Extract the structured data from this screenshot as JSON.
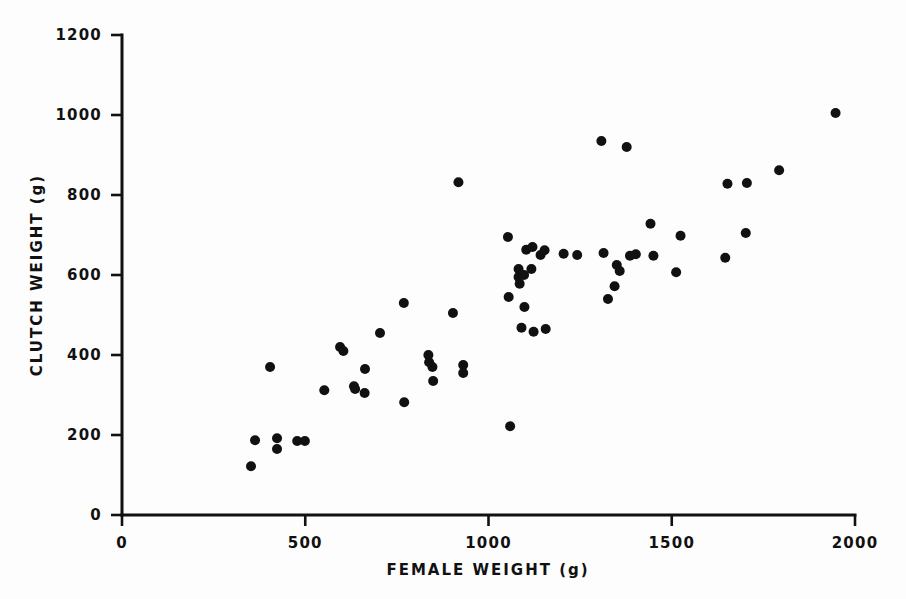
{
  "chart_data": {
    "type": "scatter",
    "title": "",
    "xlabel": "FEMALE WEIGHT (g)",
    "ylabel": "CLUTCH WEIGHT (g)",
    "xlim": [
      0,
      2000
    ],
    "ylim": [
      0,
      1200
    ],
    "xticks": [
      0,
      500,
      1000,
      1500,
      2000
    ],
    "yticks": [
      0,
      200,
      400,
      600,
      800,
      1000,
      1200
    ],
    "xtick_labels": [
      "0",
      "500",
      "1000",
      "1500",
      "2000"
    ],
    "ytick_labels": [
      "0",
      "200",
      "400",
      "600",
      "800",
      "1000",
      "1200"
    ],
    "grid": false,
    "legend": null,
    "marker": "filled-circle",
    "marker_color": "#111111",
    "marker_size_px": 10,
    "n_points": 62,
    "points": [
      [
        352,
        122
      ],
      [
        363,
        187
      ],
      [
        423,
        192
      ],
      [
        423,
        165
      ],
      [
        478,
        185
      ],
      [
        499,
        185
      ],
      [
        404,
        370
      ],
      [
        552,
        312
      ],
      [
        595,
        420
      ],
      [
        604,
        410
      ],
      [
        633,
        322
      ],
      [
        636,
        315
      ],
      [
        663,
        365
      ],
      [
        704,
        455
      ],
      [
        662,
        305
      ],
      [
        770,
        282
      ],
      [
        769,
        530
      ],
      [
        836,
        400
      ],
      [
        838,
        382
      ],
      [
        847,
        370
      ],
      [
        849,
        335
      ],
      [
        903,
        505
      ],
      [
        918,
        832
      ],
      [
        931,
        375
      ],
      [
        931,
        355
      ],
      [
        1053,
        695
      ],
      [
        1055,
        545
      ],
      [
        1059,
        222
      ],
      [
        1082,
        615
      ],
      [
        1082,
        595
      ],
      [
        1085,
        578
      ],
      [
        1090,
        468
      ],
      [
        1098,
        520
      ],
      [
        1103,
        663
      ],
      [
        1120,
        670
      ],
      [
        1123,
        458
      ],
      [
        1142,
        650
      ],
      [
        1153,
        662
      ],
      [
        1156,
        465
      ],
      [
        1205,
        653
      ],
      [
        1242,
        650
      ],
      [
        1308,
        935
      ],
      [
        1314,
        655
      ],
      [
        1326,
        540
      ],
      [
        1344,
        572
      ],
      [
        1350,
        625
      ],
      [
        1358,
        610
      ],
      [
        1377,
        920
      ],
      [
        1386,
        648
      ],
      [
        1402,
        652
      ],
      [
        1442,
        728
      ],
      [
        1450,
        648
      ],
      [
        1512,
        607
      ],
      [
        1524,
        698
      ],
      [
        1646,
        643
      ],
      [
        1652,
        828
      ],
      [
        1702,
        705
      ],
      [
        1705,
        830
      ],
      [
        1793,
        862
      ],
      [
        1947,
        1005
      ],
      [
        1117,
        615
      ],
      [
        1097,
        600
      ]
    ]
  },
  "axes": {
    "x_axis_name": "x-axis",
    "y_axis_name": "y-axis"
  }
}
